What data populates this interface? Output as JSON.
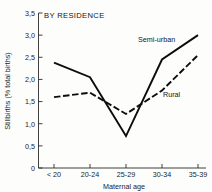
{
  "chart_data": {
    "type": "line",
    "title": "BY RESIDENCE",
    "xlabel": "Maternal age",
    "ylabel": "Stillbirths (% total births)",
    "categories": [
      "< 20",
      "20-24",
      "25-29",
      "30-34",
      "35-39"
    ],
    "series": [
      {
        "name": "Semi-urban",
        "style": "solid",
        "values": [
          2.38,
          2.05,
          0.72,
          2.45,
          3.0
        ]
      },
      {
        "name": "Rural",
        "style": "dashed",
        "values": [
          1.6,
          1.7,
          1.22,
          1.75,
          2.55
        ]
      }
    ],
    "ylim": [
      0,
      3.5
    ],
    "yticks": [
      "0",
      "0,5",
      "1,0",
      "1,5",
      "2,0",
      "2,5",
      "3,0",
      "3,5"
    ],
    "ytick_values": [
      0,
      0.5,
      1.0,
      1.5,
      2.0,
      2.5,
      3.0,
      3.5
    ],
    "grid": false,
    "legend": "inline-annotations",
    "colors": {
      "line": "#0d0d0d",
      "axis": "#2b2b2b",
      "background": "#fdfdfc"
    }
  },
  "annotations": {
    "semi_urban_label": "Semi-urban",
    "rural_label": "Rural"
  }
}
